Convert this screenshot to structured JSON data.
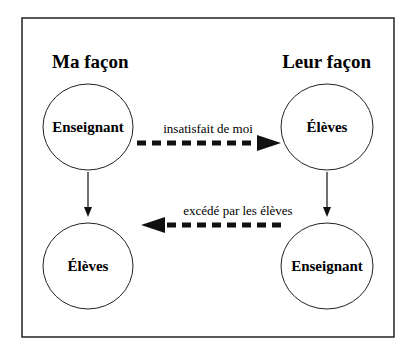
{
  "diagram": {
    "left_column": {
      "title": "Ma façon",
      "top_node": "Enseignant",
      "bottom_node": "Élèves"
    },
    "right_column": {
      "title": "Leur façon",
      "top_node": "Élèves",
      "bottom_node": "Enseignant"
    },
    "arrows": {
      "top_dashed_label": "insatisfait de moi",
      "bottom_dashed_label": "excédé par les élèves"
    },
    "colors": {
      "line": "#111111",
      "background": "#ffffff"
    }
  }
}
